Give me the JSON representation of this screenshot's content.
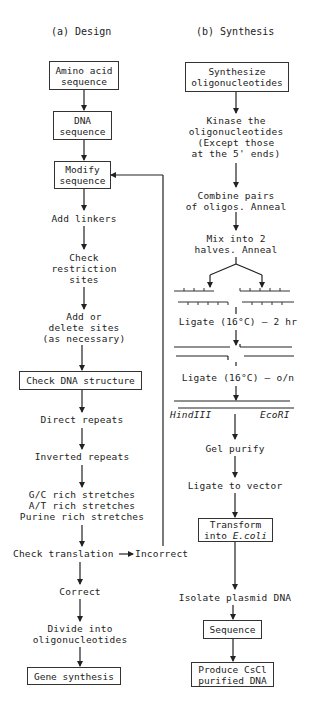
{
  "design": {
    "heading": "(a) Design",
    "steps": {
      "amino_acid": [
        "Amino acid",
        "sequence"
      ],
      "dna_sequence": [
        "DNA",
        "sequence"
      ],
      "modify": [
        "Modify",
        "sequence"
      ],
      "add_linkers": "Add linkers",
      "check_restriction": [
        "Check",
        "restriction",
        "sites"
      ],
      "add_delete": [
        "Add or",
        "delete sites",
        "(as necessary)"
      ],
      "check_dna_structure": "Check DNA structure",
      "direct_repeats": "Direct repeats",
      "inverted_repeats": "Inverted repeats",
      "stretches": [
        "G/C rich stretches",
        "A/T rich stretches",
        "Purine rich stretches"
      ],
      "check_translation": "Check translation",
      "incorrect": "Incorrect",
      "correct": "Correct",
      "divide": [
        "Divide into",
        "oligonucleotides"
      ],
      "gene_synthesis": "Gene synthesis"
    }
  },
  "synthesis": {
    "heading": "(b) Synthesis",
    "steps": {
      "synthesize": [
        "Synthesize",
        "oligonucleotides"
      ],
      "kinase": [
        "Kinase the",
        "oligonucleotides",
        "(Except those",
        "at the 5' ends)"
      ],
      "combine": [
        "Combine pairs",
        "of oligos. Anneal"
      ],
      "mix": [
        "Mix into 2",
        "halves. Anneal"
      ],
      "ligate_2hr": "Ligate (16°C) — 2 hr",
      "ligate_on": "Ligate (16°C) — o/n",
      "hindiii": "HindIII",
      "ecori": "EcoRI",
      "gel_purify": "Gel purify",
      "ligate_vector": "Ligate to vector",
      "transform": [
        "Transform",
        "into ",
        "E.coli"
      ],
      "isolate": "Isolate plasmid DNA",
      "sequence": "Sequence",
      "produce": [
        "Produce CsCl",
        "purified DNA"
      ]
    }
  }
}
